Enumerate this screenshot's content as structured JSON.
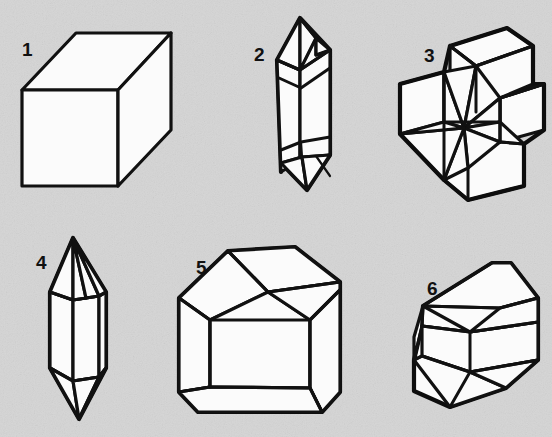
{
  "figure": {
    "kind": "crystal-forms-plate",
    "background_color": "#d5d5d5",
    "face_color": "#fbfbfb",
    "line_color": "#111111",
    "width": 552,
    "height": 437
  },
  "crystals": [
    {
      "number": "1",
      "label_x": 22,
      "label_y": 40,
      "name": "cube",
      "description": "Isometric cube drawn in oblique projection; three faces visible."
    },
    {
      "number": "2",
      "label_x": 254,
      "label_y": 45,
      "name": "hexagonal-prism-double-terminated",
      "description": "Short hexagonal prism terminated at both ends by low pyramids."
    },
    {
      "number": "3",
      "label_x": 424,
      "label_y": 46,
      "name": "six-pointed-star-twin",
      "description": "Interpenetration twin forming a six-rayed star / cross shape."
    },
    {
      "number": "4",
      "label_x": 36,
      "label_y": 253,
      "name": "slender-prism-double-pyramid",
      "description": "Slender hexagonal prism with sharp pyramidal terminations at top and bottom."
    },
    {
      "number": "5",
      "label_x": 196,
      "label_y": 258,
      "name": "blocky-polyhedron",
      "description": "Blocky many-faced crystal with bevelled edges."
    },
    {
      "number": "6",
      "label_x": 427,
      "label_y": 279,
      "name": "tabular-wedge-crystal",
      "description": "Elongated tabular crystal with a roof-like wedge termination."
    }
  ]
}
